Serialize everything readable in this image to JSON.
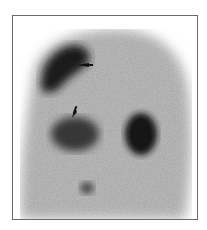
{
  "figure": {
    "type": "scintigraphy scan",
    "background_color": "#ffffff",
    "frame_color": "#6a6a6a",
    "body_tone": "#b9b9b9",
    "uptake_tone": "#2a2a2a",
    "regions": [
      {
        "name": "upper-left-uptake",
        "shade": "#1e1e1e"
      },
      {
        "name": "left-mid-uptake",
        "shade": "#3a3a3a"
      },
      {
        "name": "right-mid-uptake",
        "shade": "#141414"
      },
      {
        "name": "lower-center-spot",
        "shade": "#555555"
      }
    ],
    "annotations": [
      {
        "type": "arrow",
        "direction": "left",
        "name": "upper-arrow"
      },
      {
        "type": "arrow",
        "direction": "down-left",
        "name": "lower-arrow"
      }
    ]
  }
}
